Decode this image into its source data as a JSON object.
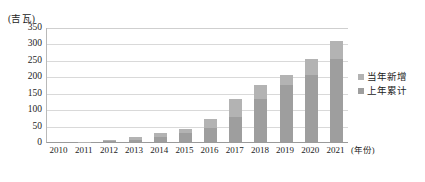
{
  "chart_data": {
    "type": "bar",
    "title": "",
    "subtitle": "",
    "unit_label": "(吉瓦)",
    "xlabel": "(年份)",
    "ylabel": "",
    "ylim": [
      0,
      350
    ],
    "ytick_step": 50,
    "grid": true,
    "stacked": true,
    "legend_position": "right",
    "categories": [
      "2010",
      "2011",
      "2012",
      "2013",
      "2014",
      "2015",
      "2016",
      "2017",
      "2018",
      "2019",
      "2020",
      "2021"
    ],
    "yticks": [
      "0",
      "50",
      "100",
      "150",
      "200",
      "250",
      "300",
      "350"
    ],
    "series": [
      {
        "name": "上年累计",
        "color": "#9e9e9e",
        "values": [
          0,
          0,
          3,
          7,
          16,
          26,
          43,
          77,
          130,
          174,
          204,
          253
        ]
      },
      {
        "name": "当年新增",
        "color": "#b3b3b3",
        "values": [
          0,
          1,
          2,
          9,
          10,
          15,
          26,
          53,
          44,
          30,
          48,
          55
        ]
      }
    ],
    "totals": [
      0,
      1,
      5,
      16,
      26,
      41,
      69,
      130,
      174,
      204,
      252,
      308
    ],
    "annotations": []
  },
  "legend": {
    "items": [
      {
        "label": "当年新增",
        "color": "#b3b3b3"
      },
      {
        "label": "上年累计",
        "color": "#9e9e9e"
      }
    ]
  }
}
